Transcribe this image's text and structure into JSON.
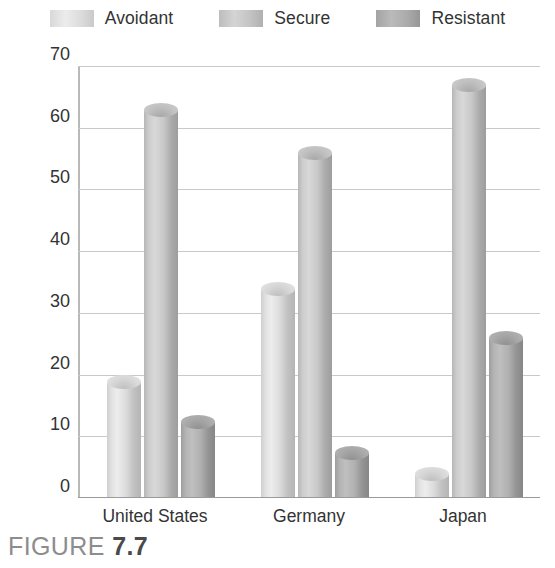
{
  "chart_data": {
    "type": "bar",
    "title": "",
    "xlabel": "",
    "ylabel": "Percentage of infants",
    "categories": [
      "United States",
      "Germany",
      "Japan"
    ],
    "series": [
      {
        "name": "Avoidant",
        "values": [
          20,
          35,
          5
        ]
      },
      {
        "name": "Secure",
        "values": [
          64,
          57,
          68
        ]
      },
      {
        "name": "Resistant",
        "values": [
          13.5,
          8.5,
          27
        ]
      }
    ],
    "ylim": [
      0,
      70
    ],
    "yticks": [
      0,
      10,
      20,
      30,
      40,
      50,
      60,
      70
    ],
    "ytick_labels": [
      "0",
      "10",
      "20",
      "30",
      "40",
      "50",
      "60",
      "70"
    ],
    "grid": true,
    "legend_position": "top",
    "series_colors": [
      "#dcdcdc",
      "#c4c4c4",
      "#ababab"
    ]
  },
  "legend": {
    "items": [
      {
        "label": "Avoidant",
        "swatch": "legend-swatch-avoidant"
      },
      {
        "label": "Secure",
        "swatch": "legend-swatch-secure"
      },
      {
        "label": "Resistant",
        "swatch": "legend-swatch-resistant"
      }
    ]
  },
  "axis": {
    "y_title": "Percentage of infants",
    "y_ticks": [
      "70",
      "60",
      "50",
      "40",
      "30",
      "20",
      "10",
      "0"
    ],
    "x_ticks": [
      "United States",
      "Germany",
      "Japan"
    ]
  },
  "caption": {
    "prefix": "FIGURE ",
    "number": "7.7"
  }
}
